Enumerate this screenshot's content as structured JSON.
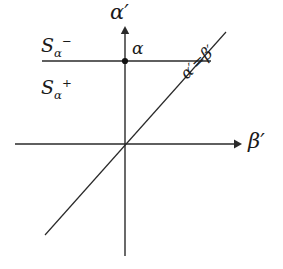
{
  "figure": {
    "background_color": "#ffffff",
    "line_color": "#2a2a2a",
    "width": 283,
    "height": 269
  },
  "axes": {
    "vertical": {
      "name": "alpha-prime-axis",
      "label_base": "α",
      "label_prime": "′",
      "x": 125,
      "y_top": 30,
      "y_bottom": 256,
      "arrow": "up"
    },
    "horizontal": {
      "name": "beta-prime-axis",
      "label_base": "β",
      "label_prime": "′",
      "y": 144,
      "x_left": 15,
      "x_right": 240,
      "arrow": "right"
    }
  },
  "point": {
    "name": "alpha-point",
    "label": "α",
    "x": 125,
    "y": 61
  },
  "boundary_line": {
    "name": "s-alpha-boundary",
    "y": 61,
    "x_left": 42,
    "x_right": 211
  },
  "diagonal": {
    "name": "alpha-equals-beta-line",
    "x1": 45,
    "y1": 235,
    "x2": 226,
    "y2": 32,
    "equation_base_left": "α",
    "equation_prime_left": "′",
    "equation_operator": "=",
    "equation_base_right": "β",
    "equation_prime_right": "′"
  },
  "regions": {
    "upper": {
      "name": "region-s-alpha-minus",
      "base": "S",
      "subscript": "α",
      "superscript": "−"
    },
    "lower": {
      "name": "region-s-alpha-plus",
      "base": "S",
      "subscript": "α",
      "superscript": "+"
    }
  }
}
